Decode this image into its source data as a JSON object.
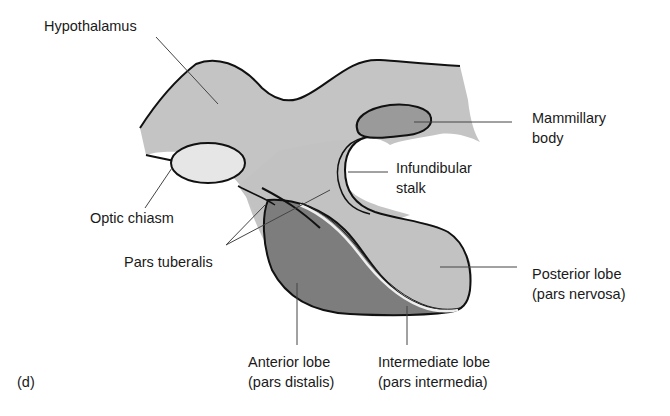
{
  "figure": {
    "panel_label": "(d)",
    "labels": {
      "hypothalamus": "Hypothalamus",
      "mammillary_line1": "Mammillary",
      "mammillary_line2": "body",
      "infundibular_line1": "Infundibular",
      "infundibular_line2": "stalk",
      "optic_chiasm": "Optic chiasm",
      "pars_tuberalis": "Pars tuberalis",
      "posterior_line1": "Posterior lobe",
      "posterior_line2": "(pars nervosa)",
      "anterior_line1": "Anterior lobe",
      "anterior_line2": "(pars distalis)",
      "intermediate_line1": "Intermediate lobe",
      "intermediate_line2": "(pars intermedia)"
    },
    "colors": {
      "hypothalamus_fill": "#c4c4c4",
      "optic_chiasm_fill": "#e6e6e6",
      "mammillary_fill": "#9a9a9a",
      "anterior_fill": "#7d7d7d",
      "posterior_fill": "#c2c2c2",
      "outline": "#111111",
      "leader": "#444444"
    }
  }
}
